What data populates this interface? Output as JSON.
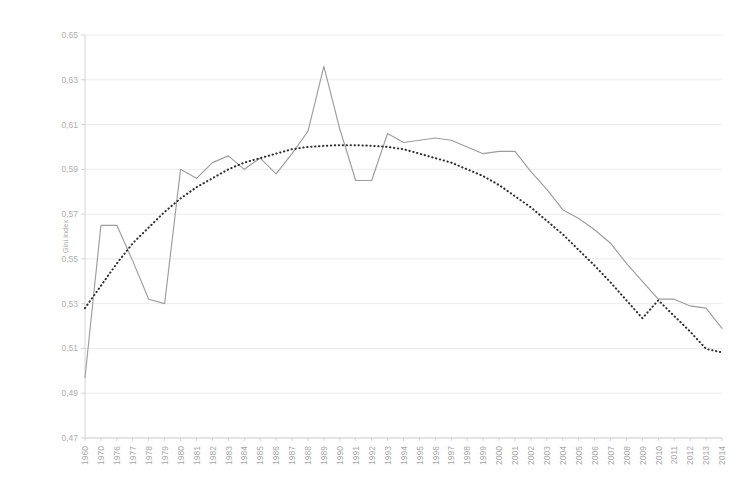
{
  "chart_data": {
    "type": "line",
    "title": "",
    "subtitle": "",
    "xlabel": "",
    "ylabel": "Gini index",
    "ylim": [
      0.47,
      0.65
    ],
    "ytick_step": 0.02,
    "ytick_labels": [
      "0,65",
      "0,63",
      "0,61",
      "0,59",
      "0,57",
      "0,55",
      "0,53",
      "0,51",
      "0,49",
      "0,47"
    ],
    "ytick_values": [
      0.65,
      0.63,
      0.61,
      0.59,
      0.57,
      0.55,
      0.53,
      0.51,
      0.49,
      0.47
    ],
    "grid": true,
    "grid_axis": "y",
    "legend": false,
    "legend_position": "none",
    "decimal_separator": ",",
    "categories": [
      "1960",
      "1970",
      "1976",
      "1977",
      "1978",
      "1979",
      "1980",
      "1981",
      "1982",
      "1983",
      "1984",
      "1985",
      "1986",
      "1987",
      "1988",
      "1989",
      "1990",
      "1991",
      "1992",
      "1993",
      "1994",
      "1995",
      "1996",
      "1997",
      "1998",
      "1999",
      "2000",
      "2001",
      "2002",
      "2003",
      "2004",
      "2005",
      "2006",
      "2007",
      "2008",
      "2009",
      "2010",
      "2011",
      "2012",
      "2013",
      "2014"
    ],
    "series": [
      {
        "name": "Gini index",
        "style": "solid",
        "color": "#9d9d9d",
        "values": [
          0.497,
          0.565,
          0.565,
          0.549,
          0.532,
          0.53,
          0.59,
          0.586,
          0.593,
          0.596,
          0.59,
          0.595,
          0.588,
          0.597,
          0.607,
          0.636,
          0.608,
          0.585,
          0.585,
          0.606,
          0.602,
          0.603,
          0.604,
          0.603,
          0.6,
          0.597,
          0.598,
          0.598,
          0.589,
          0.581,
          0.572,
          0.568,
          0.563,
          0.557,
          0.548,
          0.54,
          0.532,
          0.532,
          0.529,
          0.528,
          0.519
        ]
      },
      {
        "name": "Polynomial trendline",
        "style": "dotted",
        "color": "#2c2c2c",
        "values": [
          0.528,
          0.538,
          0.548,
          0.557,
          0.564,
          0.571,
          0.577,
          0.582,
          0.586,
          0.59,
          0.593,
          0.595,
          0.597,
          0.599,
          0.6,
          0.6005,
          0.6008,
          0.6008,
          0.6005,
          0.6,
          0.599,
          0.597,
          0.595,
          0.593,
          0.59,
          0.587,
          0.583,
          0.578,
          0.573,
          0.567,
          0.561,
          0.554,
          0.547,
          0.5395,
          0.5315,
          0.5235,
          0.5315,
          0.5245,
          0.5175,
          0.5098,
          0.5082
        ]
      }
    ]
  }
}
